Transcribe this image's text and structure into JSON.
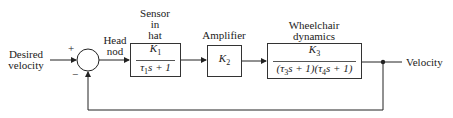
{
  "input": {
    "label_line1": "Desired",
    "label_line2": "velocity"
  },
  "summing_junction": {
    "plus_sign": "+",
    "minus_sign": "−"
  },
  "head_nod": {
    "line1": "Head",
    "line2": "nod"
  },
  "sensor": {
    "title_line1": "Sensor",
    "title_line2": "in",
    "title_line3": "hat",
    "gain": "K",
    "gain_sub": "1",
    "den_tau": "τ",
    "den_sub": "1",
    "den_rest": "s + 1"
  },
  "amplifier": {
    "title": "Amplifier",
    "gain": "K",
    "gain_sub": "2"
  },
  "wheelchair": {
    "title_line1": "Wheelchair",
    "title_line2": "dynamics",
    "gain": "K",
    "gain_sub": "3",
    "den_part1": "(τ",
    "den_sub1": "3",
    "den_part2": "s + 1)(τ",
    "den_sub2": "4",
    "den_part3": "s + 1)"
  },
  "output": {
    "label": "Velocity"
  }
}
